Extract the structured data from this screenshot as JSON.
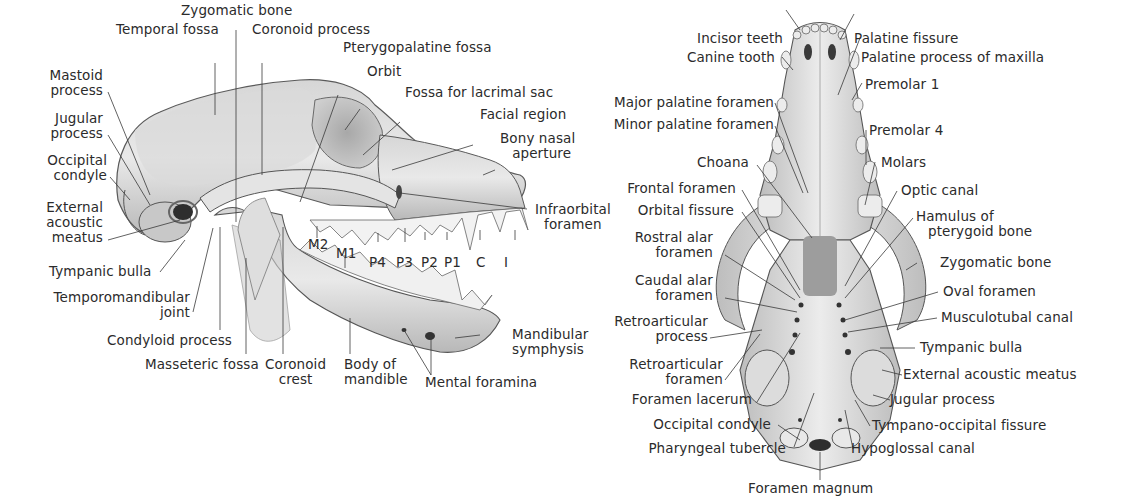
{
  "figure": {
    "lateral_view": {
      "name": "Lateral view of skull",
      "labels": {
        "zygomatic_bone": "Zygomatic bone",
        "temporal_fossa": "Temporal fossa",
        "coronoid_process": "Coronoid process",
        "pterygopalatine_fossa": "Pterygopalatine fossa",
        "orbit": "Orbit",
        "fossa_lacrimal_sac": "Fossa for lacrimal sac",
        "facial_region": "Facial region",
        "bony_nasal_aperture_1": "Bony nasal",
        "bony_nasal_aperture_2": "aperture",
        "infraorbital_foramen_1": "Infraorbital",
        "infraorbital_foramen_2": "foramen",
        "mastoid_process_1": "Mastoid",
        "mastoid_process_2": "process",
        "jugular_process_1": "Jugular",
        "jugular_process_2": "process",
        "occipital_condyle_1": "Occipital",
        "occipital_condyle_2": "condyle",
        "external_acoustic_meatus_1": "External",
        "external_acoustic_meatus_2": "acoustic",
        "external_acoustic_meatus_3": "meatus",
        "tympanic_bulla": "Tympanic bulla",
        "temporomandibular_joint_1": "Temporomandibular",
        "temporomandibular_joint_2": "joint",
        "condyloid_process": "Condyloid process",
        "masseteric_fossa": "Masseteric fossa",
        "coronoid_crest_1": "Coronoid",
        "coronoid_crest_2": "crest",
        "body_of_mandible_1": "Body of",
        "body_of_mandible_2": "mandible",
        "mental_foramina": "Mental foramina",
        "mandibular_symphysis_1": "Mandibular",
        "mandibular_symphysis_2": "symphysis"
      },
      "teeth": [
        "M2",
        "M1",
        "P4",
        "P3",
        "P2",
        "P1",
        "C",
        "I"
      ]
    },
    "ventral_view": {
      "name": "Ventral view of skull",
      "labels": {
        "incisor_teeth": "Incisor teeth",
        "canine_tooth": "Canine tooth",
        "major_palatine_foramen": "Major palatine foramen",
        "minor_palatine_foramen": "Minor palatine foramen",
        "choana": "Choana",
        "frontal_foramen": "Frontal foramen",
        "orbital_fissure": "Orbital fissure",
        "rostral_alar_foramen_1": "Rostral alar",
        "rostral_alar_foramen_2": "foramen",
        "caudal_alar_foramen_1": "Caudal alar",
        "caudal_alar_foramen_2": "foramen",
        "retroarticular_process_1": "Retroarticular",
        "retroarticular_process_2": "process",
        "retroarticular_foramen_1": "Retroarticular",
        "retroarticular_foramen_2": "foramen",
        "foramen_lacerum": "Foramen lacerum",
        "occipital_condyle": "Occipital condyle",
        "pharyngeal_tubercle": "Pharyngeal tubercle",
        "foramen_magnum": "Foramen magnum",
        "palatine_fissure": "Palatine fissure",
        "palatine_process_maxilla": "Palatine process of maxilla",
        "premolar_1": "Premolar 1",
        "premolar_4": "Premolar 4",
        "molars": "Molars",
        "optic_canal": "Optic canal",
        "hamulus_1": "Hamulus of",
        "hamulus_2": "pterygoid bone",
        "zygomatic_bone": "Zygomatic bone",
        "oval_foramen": "Oval foramen",
        "musculotubal_canal": "Musculotubal canal",
        "tympanic_bulla": "Tympanic bulla",
        "external_acoustic_meatus": "External acoustic meatus",
        "jugular_process": "Jugular process",
        "tympano_occipital_fissure": "Tympano-occipital fissure",
        "hypoglossal_canal": "Hypoglossal canal"
      }
    },
    "colors": {
      "text": "#2b2b2b",
      "leader": "#3a3a3a",
      "bone_light": "#e6e6e6",
      "bone_mid": "#c4c4c4",
      "bone_dark": "#8a8a8a",
      "outline": "#4a4a4a"
    }
  }
}
